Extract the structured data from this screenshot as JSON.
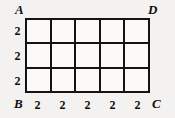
{
  "figure": {
    "type": "geometry-grid-diagram",
    "background_color": "#f3f2f0",
    "line_color": "#141414",
    "grid": {
      "columns": 5,
      "rows": 3
    },
    "vertices": {
      "top_left": "A",
      "top_right": "D",
      "bottom_left": "B",
      "bottom_right": "C"
    },
    "left_measures": [
      "2",
      "2",
      "2"
    ],
    "bottom_measures": [
      "2",
      "2",
      "2",
      "2",
      "2"
    ]
  }
}
